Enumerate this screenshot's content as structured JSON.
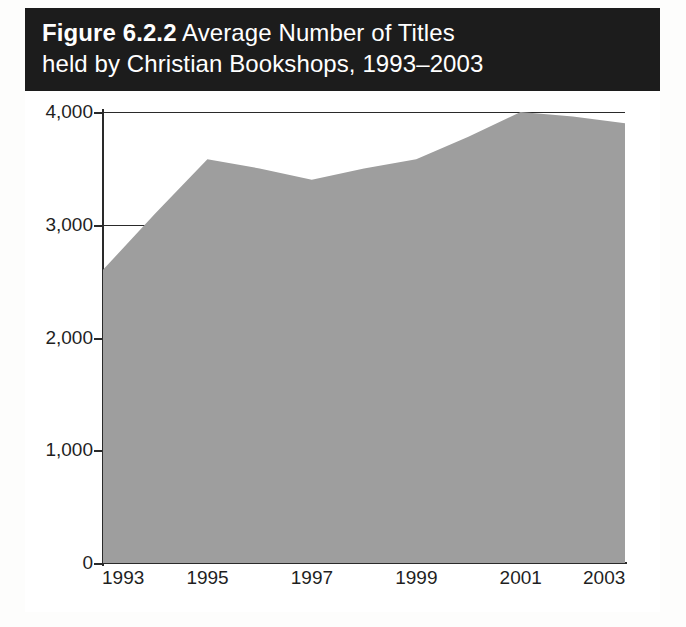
{
  "figure": {
    "label": "Figure 6.2.2",
    "title_line1_rest": " Average Number of Titles",
    "title_line2": "held by Christian Bookshops, 1993–2003",
    "banner_color": "#1c1c1c",
    "banner_text_color": "#ffffff",
    "frame_color": "#141414"
  },
  "chart_data": {
    "type": "area",
    "title": "Figure 6.2.2 Average Number of Titles held by Christian Bookshops, 1993–2003",
    "xlabel": "",
    "ylabel": "",
    "x": [
      1993,
      1994,
      1995,
      1996,
      1997,
      1998,
      1999,
      2000,
      2001,
      2002,
      2003
    ],
    "values": [
      2600,
      3100,
      3580,
      3500,
      3400,
      3500,
      3580,
      3780,
      4000,
      3960,
      3900
    ],
    "series": [
      {
        "name": "Average number of titles",
        "values": [
          2600,
          3100,
          3580,
          3500,
          3400,
          3500,
          3580,
          3780,
          4000,
          3960,
          3900
        ]
      }
    ],
    "xlim": [
      1993,
      2003
    ],
    "ylim": [
      0,
      4000
    ],
    "x_tick_labels": [
      "1993",
      "1995",
      "1997",
      "1999",
      "2001",
      "2003"
    ],
    "x_tick_values": [
      1993,
      1995,
      1997,
      1999,
      2001,
      2003
    ],
    "y_tick_labels": [
      "0",
      "1,000",
      "2,000",
      "3,000",
      "4,000"
    ],
    "y_tick_values": [
      0,
      1000,
      2000,
      3000,
      4000
    ],
    "grid": "horizontal-partial",
    "legend": "none",
    "area_fill_color": "#9e9e9e",
    "axis_color": "#2a2a2a",
    "plot_background": "#ffffff"
  }
}
